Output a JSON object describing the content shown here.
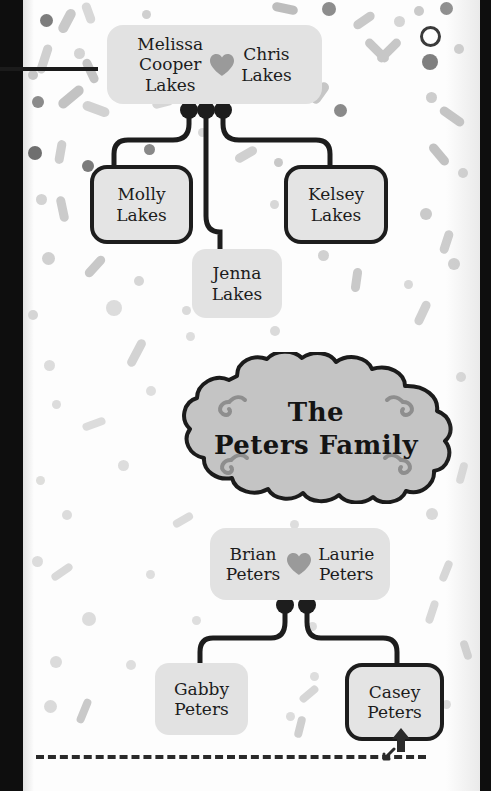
{
  "canvas": {
    "width": 491,
    "height": 791,
    "paper_color": "#fdfdfd",
    "bezel_color": "#0e0e0e"
  },
  "theme": {
    "node_fill": "#e2e2e2",
    "node_outline": "#1d1d1d",
    "wire_color": "#1d1d1d",
    "heart_color": "#9a9a9a",
    "cloud_fill": "#c4c4c4",
    "cloud_outline": "#1b1b1b",
    "flourish_color": "#8e8e8e",
    "text_color": "#1c1c1c",
    "confetti_light": "#e8e8e8",
    "confetti_mid": "#c9c9c9",
    "confetti_dark": "#7d7d7d"
  },
  "title_banner": {
    "line1": "The",
    "line2": "Peters Family",
    "shape": "cloud",
    "flourishes": 4
  },
  "families": [
    {
      "id": "lakes",
      "couple": {
        "left": {
          "lines": [
            "Melissa",
            "Cooper",
            "Lakes"
          ]
        },
        "right": {
          "lines": [
            "Chris",
            "Lakes"
          ]
        },
        "link_icon": "heart-icon"
      },
      "children": [
        {
          "name_lines": [
            "Molly",
            "Lakes"
          ],
          "highlighted": true
        },
        {
          "name_lines": [
            "Jenna",
            "Lakes"
          ],
          "highlighted": false
        },
        {
          "name_lines": [
            "Kelsey",
            "Lakes"
          ],
          "highlighted": true
        }
      ]
    },
    {
      "id": "peters",
      "couple": {
        "left": {
          "lines": [
            "Brian",
            "Peters"
          ]
        },
        "right": {
          "lines": [
            "Laurie",
            "Peters"
          ]
        },
        "link_icon": "heart-icon"
      },
      "children": [
        {
          "name_lines": [
            "Gabby",
            "Peters"
          ],
          "highlighted": false
        },
        {
          "name_lines": [
            "Casey",
            "Peters"
          ],
          "highlighted": true
        }
      ]
    }
  ],
  "annotations": {
    "dashed_rule": "dashed-separator",
    "cursor_up": "arrow-up-cursor",
    "cursor_diagonal": "arrow-diagonal-cursor",
    "top_rule": "top-left-rule"
  },
  "confetti": [
    {
      "t": "bar",
      "x": 40,
      "y": 8,
      "w": 10,
      "h": 26,
      "r": 28,
      "c": "#c9c9c9"
    },
    {
      "t": "dot",
      "x": 18,
      "y": 14,
      "w": 13,
      "h": 13,
      "c": "#7d7d7d"
    },
    {
      "t": "bar",
      "x": 62,
      "y": 2,
      "w": 9,
      "h": 22,
      "r": -20,
      "c": "#d8d8d8"
    },
    {
      "t": "dot",
      "x": 120,
      "y": 10,
      "w": 9,
      "h": 9,
      "c": "#cfcfcf"
    },
    {
      "t": "bar",
      "x": 250,
      "y": 4,
      "w": 26,
      "h": 9,
      "r": 12,
      "c": "#bdbdbd"
    },
    {
      "t": "dot",
      "x": 300,
      "y": 2,
      "w": 14,
      "h": 14,
      "c": "#8d8d8d"
    },
    {
      "t": "bar",
      "x": 330,
      "y": 16,
      "w": 24,
      "h": 9,
      "r": -35,
      "c": "#c9c9c9"
    },
    {
      "t": "dot",
      "x": 392,
      "y": 6,
      "w": 10,
      "h": 10,
      "c": "#cacaca"
    },
    {
      "t": "dot",
      "x": 418,
      "y": 2,
      "w": 13,
      "h": 13,
      "c": "#8f8f8f"
    },
    {
      "t": "bar",
      "x": 18,
      "y": 44,
      "w": 9,
      "h": 30,
      "r": 18,
      "c": "#d0d0d0"
    },
    {
      "t": "dot",
      "x": 52,
      "y": 48,
      "w": 11,
      "h": 11,
      "c": "#d4d4d4"
    },
    {
      "t": "bar",
      "x": 64,
      "y": 58,
      "w": 9,
      "h": 26,
      "r": -25,
      "c": "#c4c4c4"
    },
    {
      "t": "dot",
      "x": 6,
      "y": 70,
      "w": 10,
      "h": 10,
      "c": "#c6c6c6"
    },
    {
      "t": "bar",
      "x": 340,
      "y": 46,
      "w": 30,
      "h": 9,
      "r": 45,
      "c": "#c7c7c7"
    },
    {
      "t": "bar",
      "x": 352,
      "y": 46,
      "w": 30,
      "h": 9,
      "r": -45,
      "c": "#c7c7c7"
    },
    {
      "t": "ring",
      "x": 398,
      "y": 26,
      "w": 15,
      "h": 15,
      "c": "#3a3a3a"
    },
    {
      "t": "dot",
      "x": 372,
      "y": 16,
      "w": 11,
      "h": 11,
      "c": "#d5d5d5"
    },
    {
      "t": "dot",
      "x": 400,
      "y": 54,
      "w": 16,
      "h": 16,
      "c": "#7f7f7f"
    },
    {
      "t": "dot",
      "x": 432,
      "y": 44,
      "w": 10,
      "h": 10,
      "c": "#cfcfcf"
    },
    {
      "t": "dot",
      "x": 10,
      "y": 96,
      "w": 12,
      "h": 12,
      "c": "#8b8b8b"
    },
    {
      "t": "bar",
      "x": 34,
      "y": 92,
      "w": 30,
      "h": 10,
      "r": -40,
      "c": "#c3c3c3"
    },
    {
      "t": "bar",
      "x": 60,
      "y": 104,
      "w": 28,
      "h": 10,
      "r": 20,
      "c": "#d2d2d2"
    },
    {
      "t": "bar",
      "x": 130,
      "y": 98,
      "w": 22,
      "h": 9,
      "r": -15,
      "c": "#d6d6d6"
    },
    {
      "t": "dot",
      "x": 176,
      "y": 128,
      "w": 9,
      "h": 9,
      "c": "#d9d9d9"
    },
    {
      "t": "bar",
      "x": 286,
      "y": 88,
      "w": 24,
      "h": 10,
      "r": -55,
      "c": "#c6c6c6"
    },
    {
      "t": "dot",
      "x": 312,
      "y": 104,
      "w": 13,
      "h": 13,
      "c": "#8a8a8a"
    },
    {
      "t": "dot",
      "x": 404,
      "y": 92,
      "w": 11,
      "h": 11,
      "c": "#cdcdcd"
    },
    {
      "t": "bar",
      "x": 416,
      "y": 112,
      "w": 28,
      "h": 9,
      "r": 35,
      "c": "#c5c5c5"
    },
    {
      "t": "dot",
      "x": 6,
      "y": 146,
      "w": 14,
      "h": 14,
      "c": "#6f6f6f"
    },
    {
      "t": "bar",
      "x": 34,
      "y": 140,
      "w": 9,
      "h": 24,
      "r": 10,
      "c": "#cecece"
    },
    {
      "t": "dot",
      "x": 60,
      "y": 160,
      "w": 12,
      "h": 12,
      "c": "#7b7b7b"
    },
    {
      "t": "dot",
      "x": 122,
      "y": 144,
      "w": 11,
      "h": 11,
      "c": "#888888"
    },
    {
      "t": "bar",
      "x": 212,
      "y": 150,
      "w": 24,
      "h": 9,
      "r": -30,
      "c": "#d0d0d0"
    },
    {
      "t": "dot",
      "x": 252,
      "y": 158,
      "w": 9,
      "h": 9,
      "c": "#c8c8c8"
    },
    {
      "t": "bar",
      "x": 404,
      "y": 150,
      "w": 26,
      "h": 9,
      "r": 50,
      "c": "#c2c2c2"
    },
    {
      "t": "dot",
      "x": 436,
      "y": 168,
      "w": 10,
      "h": 10,
      "c": "#d2d2d2"
    },
    {
      "t": "dot",
      "x": 14,
      "y": 194,
      "w": 11,
      "h": 11,
      "c": "#d3d3d3"
    },
    {
      "t": "bar",
      "x": 36,
      "y": 196,
      "w": 9,
      "h": 26,
      "r": -12,
      "c": "#cbcbcb"
    },
    {
      "t": "dot",
      "x": 74,
      "y": 214,
      "w": 10,
      "h": 10,
      "c": "#d4d4d4"
    },
    {
      "t": "dot",
      "x": 248,
      "y": 200,
      "w": 9,
      "h": 9,
      "c": "#d7d7d7"
    },
    {
      "t": "bar",
      "x": 268,
      "y": 226,
      "w": 22,
      "h": 9,
      "r": 20,
      "c": "#d1d1d1"
    },
    {
      "t": "dot",
      "x": 398,
      "y": 208,
      "w": 12,
      "h": 12,
      "c": "#cacaca"
    },
    {
      "t": "bar",
      "x": 420,
      "y": 230,
      "w": 9,
      "h": 24,
      "r": 18,
      "c": "#cdcdcd"
    },
    {
      "t": "dot",
      "x": 20,
      "y": 252,
      "w": 13,
      "h": 13,
      "c": "#d0d0d0"
    },
    {
      "t": "bar",
      "x": 60,
      "y": 262,
      "w": 26,
      "h": 9,
      "r": -48,
      "c": "#c8c8c8"
    },
    {
      "t": "dot",
      "x": 112,
      "y": 276,
      "w": 10,
      "h": 10,
      "c": "#d6d6d6"
    },
    {
      "t": "dot",
      "x": 296,
      "y": 250,
      "w": 11,
      "h": 11,
      "c": "#d1d1d1"
    },
    {
      "t": "bar",
      "x": 330,
      "y": 268,
      "w": 9,
      "h": 24,
      "r": 8,
      "c": "#c9c9c9"
    },
    {
      "t": "dot",
      "x": 382,
      "y": 280,
      "w": 9,
      "h": 9,
      "c": "#d8d8d8"
    },
    {
      "t": "dot",
      "x": 426,
      "y": 258,
      "w": 12,
      "h": 12,
      "c": "#cfcfcf"
    },
    {
      "t": "dot",
      "x": 6,
      "y": 310,
      "w": 10,
      "h": 10,
      "c": "#d5d5d5"
    },
    {
      "t": "dot",
      "x": 84,
      "y": 300,
      "w": 16,
      "h": 16,
      "c": "#dcdcdc"
    },
    {
      "t": "dot",
      "x": 160,
      "y": 306,
      "w": 9,
      "h": 9,
      "c": "#dadada"
    },
    {
      "t": "bar",
      "x": 396,
      "y": 300,
      "w": 9,
      "h": 26,
      "r": 25,
      "c": "#d0d0d0"
    },
    {
      "t": "dot",
      "x": 248,
      "y": 326,
      "w": 10,
      "h": 10,
      "c": "#dadada"
    },
    {
      "t": "dot",
      "x": 164,
      "y": 332,
      "w": 9,
      "h": 9,
      "c": "#dddddd"
    },
    {
      "t": "bar",
      "x": 110,
      "y": 338,
      "w": 9,
      "h": 30,
      "r": 28,
      "c": "#d3d3d3"
    },
    {
      "t": "dot",
      "x": 22,
      "y": 360,
      "w": 11,
      "h": 11,
      "c": "#dcdcdc"
    },
    {
      "t": "dot",
      "x": 124,
      "y": 386,
      "w": 10,
      "h": 10,
      "c": "#dedede"
    },
    {
      "t": "dot",
      "x": 30,
      "y": 400,
      "w": 9,
      "h": 9,
      "c": "#dcdcdc"
    },
    {
      "t": "bar",
      "x": 60,
      "y": 420,
      "w": 24,
      "h": 8,
      "r": -20,
      "c": "#dcdcdc"
    },
    {
      "t": "dot",
      "x": 434,
      "y": 372,
      "w": 10,
      "h": 10,
      "c": "#dadada"
    },
    {
      "t": "dot",
      "x": 420,
      "y": 420,
      "w": 9,
      "h": 9,
      "c": "#dedede"
    },
    {
      "t": "dot",
      "x": 96,
      "y": 460,
      "w": 11,
      "h": 11,
      "c": "#dddddd"
    },
    {
      "t": "dot",
      "x": 14,
      "y": 476,
      "w": 9,
      "h": 9,
      "c": "#dededc"
    },
    {
      "t": "bar",
      "x": 436,
      "y": 462,
      "w": 8,
      "h": 22,
      "r": 15,
      "c": "#dcdcdc"
    },
    {
      "t": "dot",
      "x": 40,
      "y": 510,
      "w": 10,
      "h": 10,
      "c": "#dcdcdc"
    },
    {
      "t": "bar",
      "x": 150,
      "y": 516,
      "w": 22,
      "h": 8,
      "r": -30,
      "c": "#dbdbdb"
    },
    {
      "t": "dot",
      "x": 268,
      "y": 520,
      "w": 9,
      "h": 9,
      "c": "#dddddd"
    },
    {
      "t": "dot",
      "x": 404,
      "y": 508,
      "w": 12,
      "h": 12,
      "c": "#d9d9d9"
    },
    {
      "t": "dot",
      "x": 10,
      "y": 556,
      "w": 11,
      "h": 11,
      "c": "#dcdcdc"
    },
    {
      "t": "bar",
      "x": 28,
      "y": 568,
      "w": 24,
      "h": 8,
      "r": -35,
      "c": "#d9d9d9"
    },
    {
      "t": "dot",
      "x": 124,
      "y": 570,
      "w": 9,
      "h": 9,
      "c": "#dedede"
    },
    {
      "t": "bar",
      "x": 420,
      "y": 560,
      "w": 8,
      "h": 22,
      "r": 22,
      "c": "#d7d7d7"
    },
    {
      "t": "dot",
      "x": 60,
      "y": 612,
      "w": 14,
      "h": 14,
      "c": "#dcdcdc"
    },
    {
      "t": "dot",
      "x": 170,
      "y": 616,
      "w": 9,
      "h": 9,
      "c": "#dedede"
    },
    {
      "t": "dot",
      "x": 286,
      "y": 622,
      "w": 9,
      "h": 9,
      "c": "#dddddd"
    },
    {
      "t": "bar",
      "x": 406,
      "y": 600,
      "w": 8,
      "h": 24,
      "r": 18,
      "c": "#d8d8d8"
    },
    {
      "t": "dot",
      "x": 28,
      "y": 656,
      "w": 12,
      "h": 12,
      "c": "#dbdbdb"
    },
    {
      "t": "dot",
      "x": 104,
      "y": 660,
      "w": 10,
      "h": 10,
      "c": "#dedede"
    },
    {
      "t": "dot",
      "x": 288,
      "y": 672,
      "w": 9,
      "h": 9,
      "c": "#dddddd"
    },
    {
      "t": "bar",
      "x": 276,
      "y": 690,
      "w": 22,
      "h": 8,
      "r": -40,
      "c": "#d6d6d6"
    },
    {
      "t": "dot",
      "x": 22,
      "y": 700,
      "w": 13,
      "h": 13,
      "c": "#dadada"
    },
    {
      "t": "bar",
      "x": 58,
      "y": 698,
      "w": 8,
      "h": 26,
      "r": 22,
      "c": "#c9c9c9"
    },
    {
      "t": "dot",
      "x": 264,
      "y": 712,
      "w": 9,
      "h": 9,
      "c": "#dcdcdc"
    },
    {
      "t": "bar",
      "x": 274,
      "y": 716,
      "w": 8,
      "h": 22,
      "r": 14,
      "c": "#cfcfcf"
    },
    {
      "t": "dot",
      "x": 420,
      "y": 700,
      "w": 9,
      "h": 9,
      "c": "#dcdcdc"
    },
    {
      "t": "bar",
      "x": 440,
      "y": 640,
      "w": 8,
      "h": 20,
      "r": -18,
      "c": "#d4d4d4"
    }
  ]
}
